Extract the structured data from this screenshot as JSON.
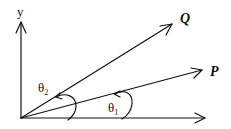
{
  "diagram": {
    "axes": {
      "y_label": "y",
      "origin": [
        21,
        118
      ],
      "x_end": [
        205,
        118
      ],
      "y_end": [
        21,
        22
      ]
    },
    "vectors": [
      {
        "name": "Q",
        "label": "Q",
        "tip": [
          172,
          24
        ],
        "label_pos": [
          180,
          23
        ]
      },
      {
        "name": "P",
        "label": "P",
        "tip": [
          202,
          70
        ],
        "label_pos": [
          210,
          76
        ]
      }
    ],
    "angles": [
      {
        "name": "theta1",
        "symbol": "θ",
        "subscript": "1",
        "label_pos": [
          110,
          114
        ]
      },
      {
        "name": "theta2",
        "symbol": "θ",
        "subscript": "2",
        "label_pos": [
          38,
          92
        ]
      }
    ],
    "color": "#111111"
  }
}
